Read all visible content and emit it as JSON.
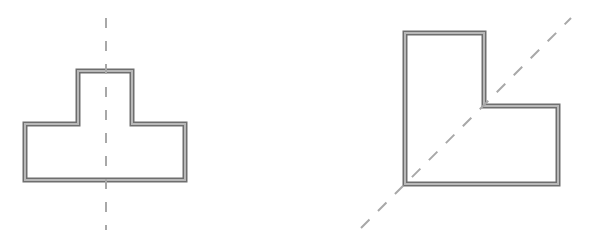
{
  "diagram": {
    "title": "",
    "colors": {
      "background": "#ffffff",
      "wall_outer": "#6e6e6e",
      "wall_fill": "#b8b8b8",
      "axis": "#a8a8a8"
    },
    "shapes": [
      {
        "name": "T-shape",
        "points": "25,124 78,124 78,71 132,71 132,124 185,124 185,180 25,180",
        "axis": {
          "type": "vertical",
          "x1": 106,
          "y1": 18,
          "x2": 106,
          "y2": 230
        }
      },
      {
        "name": "L-shape",
        "points": "405,33 484,33 484,106 558,106 558,184 405,184",
        "axis": {
          "type": "diagonal",
          "x1": 361,
          "y1": 228,
          "x2": 571,
          "y2": 18
        }
      }
    ]
  }
}
